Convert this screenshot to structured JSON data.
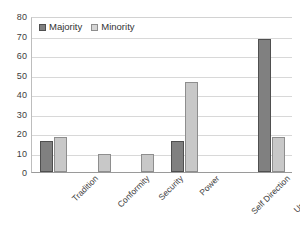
{
  "chart_data": {
    "type": "bar",
    "title": "",
    "subtitle": "",
    "xlabel": "",
    "ylabel": "",
    "categories": [
      "Tradition",
      "Conformity",
      "Security",
      "Power",
      "Self Direction",
      "Universalism"
    ],
    "series": [
      {
        "name": "Majority",
        "color": "#808080",
        "values": [
          16,
          0,
          0,
          16,
          0,
          68
        ]
      },
      {
        "name": "Minority",
        "color": "#c8c8c8",
        "values": [
          18,
          9,
          9,
          46,
          0,
          18
        ]
      }
    ],
    "ylim": [
      0,
      80
    ],
    "ytick_step": 10,
    "yticks": [
      80,
      70,
      60,
      50,
      40,
      30,
      20,
      10,
      0
    ],
    "ytick_labels": [
      "80",
      "70",
      "60",
      "50",
      "40",
      "30",
      "20",
      "10",
      "0"
    ],
    "grid": "horizontal",
    "legend_position": "top-left-inside",
    "legend_entries": [
      "Majority",
      "Minority"
    ],
    "x_label_rotation": -45,
    "background_color": "#ffffff",
    "gridline_color": "#d8d8d8",
    "axis_color": "#9a9a9a",
    "bar_outline_color": "#5e5e5e"
  }
}
